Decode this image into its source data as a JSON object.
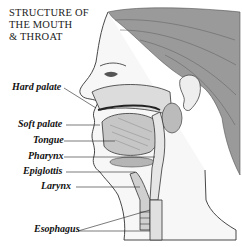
{
  "title": {
    "line1": "STRUCTURE OF",
    "line2": "THE MOUTH",
    "line3": "& THROAT"
  },
  "labels": [
    {
      "id": "hard-palate",
      "text": "Hard palate"
    },
    {
      "id": "soft-palate",
      "text": "Soft palate"
    },
    {
      "id": "tongue",
      "text": "Tongue"
    },
    {
      "id": "pharynx",
      "text": "Pharynx"
    },
    {
      "id": "epiglottis",
      "text": "Epiglottis"
    },
    {
      "id": "larynx",
      "text": "Larynx"
    },
    {
      "id": "esophagus",
      "text": "Esophagus"
    }
  ],
  "colors": {
    "ink": "#222222",
    "hair": "#7a7a7a",
    "tissue": "#d8d8d8",
    "background": "#ffffff"
  }
}
